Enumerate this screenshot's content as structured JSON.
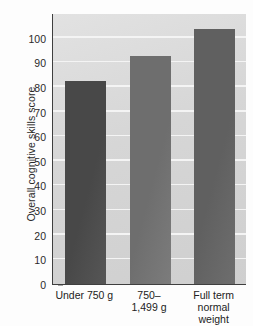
{
  "chart_data": {
    "type": "bar",
    "title": "",
    "subtitle": "",
    "xlabel": "",
    "ylabel": "Overall cognitive skills score",
    "categories": [
      "Under 750 g",
      "750–\n1,499 g",
      "Full term\nnormal\nweight"
    ],
    "values": [
      82.5,
      92.5,
      103.5
    ],
    "ylim": [
      0,
      110
    ],
    "yticks": [
      0,
      10,
      20,
      30,
      40,
      50,
      60,
      70,
      80,
      90,
      100
    ],
    "ytick_labels": [
      "0",
      "10",
      "20",
      "30",
      "40",
      "50",
      "60",
      "70",
      "80",
      "90",
      "100"
    ],
    "grid": "horizontal-white",
    "legend": "none",
    "bar_colors": [
      "#484848",
      "#6e6e6e",
      "#606060"
    ],
    "plot_background": "#d8d8d8",
    "gridline_color": "#f4f4f4",
    "axis_color": "#3f3f3f"
  }
}
